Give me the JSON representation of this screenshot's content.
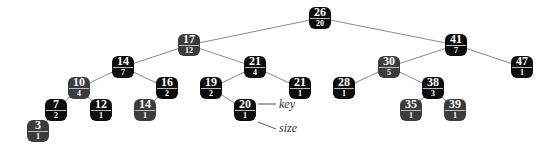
{
  "diagram": {
    "title": "",
    "nodes": [
      {
        "id": "n26",
        "key": "26",
        "size": "20",
        "x": 320,
        "y": 18,
        "shade": "black"
      },
      {
        "id": "n17",
        "key": "17",
        "size": "12",
        "x": 189,
        "y": 45,
        "shade": "gray"
      },
      {
        "id": "n41",
        "key": "41",
        "size": "7",
        "x": 456,
        "y": 45,
        "shade": "black"
      },
      {
        "id": "n14a",
        "key": "14",
        "size": "7",
        "x": 123,
        "y": 67,
        "shade": "black"
      },
      {
        "id": "n21a",
        "key": "21",
        "size": "4",
        "x": 255,
        "y": 67,
        "shade": "black"
      },
      {
        "id": "n30",
        "key": "30",
        "size": "5",
        "x": 389,
        "y": 67,
        "shade": "gray"
      },
      {
        "id": "n47",
        "key": "47",
        "size": "1",
        "x": 522,
        "y": 67,
        "shade": "black"
      },
      {
        "id": "n10",
        "key": "10",
        "size": "4",
        "x": 79,
        "y": 88,
        "shade": "gray"
      },
      {
        "id": "n16",
        "key": "16",
        "size": "2",
        "x": 167,
        "y": 88,
        "shade": "black"
      },
      {
        "id": "n19",
        "key": "19",
        "size": "2",
        "x": 211,
        "y": 88,
        "shade": "black"
      },
      {
        "id": "n21b",
        "key": "21",
        "size": "1",
        "x": 300,
        "y": 88,
        "shade": "black"
      },
      {
        "id": "n28",
        "key": "28",
        "size": "1",
        "x": 344,
        "y": 88,
        "shade": "black"
      },
      {
        "id": "n38",
        "key": "38",
        "size": "3",
        "x": 433,
        "y": 88,
        "shade": "black"
      },
      {
        "id": "n7",
        "key": "7",
        "size": "2",
        "x": 56,
        "y": 110,
        "shade": "black"
      },
      {
        "id": "n12",
        "key": "12",
        "size": "1",
        "x": 101,
        "y": 110,
        "shade": "black"
      },
      {
        "id": "n14b",
        "key": "14",
        "size": "1",
        "x": 145,
        "y": 110,
        "shade": "gray"
      },
      {
        "id": "n20",
        "key": "20",
        "size": "1",
        "x": 245,
        "y": 110,
        "shade": "black"
      },
      {
        "id": "n35",
        "key": "35",
        "size": "1",
        "x": 411,
        "y": 110,
        "shade": "gray"
      },
      {
        "id": "n39",
        "key": "39",
        "size": "1",
        "x": 455,
        "y": 110,
        "shade": "gray"
      },
      {
        "id": "n3",
        "key": "3",
        "size": "1",
        "x": 38,
        "y": 131,
        "shade": "gray"
      }
    ],
    "edges": [
      [
        "n26",
        "n17"
      ],
      [
        "n26",
        "n41"
      ],
      [
        "n17",
        "n14a"
      ],
      [
        "n17",
        "n21a"
      ],
      [
        "n41",
        "n30"
      ],
      [
        "n41",
        "n47"
      ],
      [
        "n14a",
        "n10"
      ],
      [
        "n14a",
        "n16"
      ],
      [
        "n21a",
        "n19"
      ],
      [
        "n21a",
        "n21b"
      ],
      [
        "n30",
        "n28"
      ],
      [
        "n30",
        "n38"
      ],
      [
        "n10",
        "n7"
      ],
      [
        "n10",
        "n12"
      ],
      [
        "n16",
        "n14b"
      ],
      [
        "n19",
        "n20"
      ],
      [
        "n38",
        "n35"
      ],
      [
        "n38",
        "n39"
      ],
      [
        "n7",
        "n3"
      ]
    ],
    "annotations": {
      "key_label": "key",
      "size_label": "size"
    }
  }
}
